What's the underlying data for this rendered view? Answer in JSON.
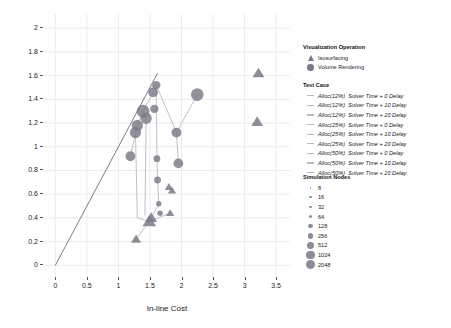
{
  "chart_data": {
    "type": "scatter",
    "title": "",
    "xlabel": "In-line Cost",
    "ylabel": "In-transit Cost",
    "xlim": [
      -0.18,
      3.72
    ],
    "ylim": [
      -0.09,
      2.12
    ],
    "xticks": [
      "0",
      "0.5",
      "1",
      "1.5",
      "2",
      "2.5",
      "3",
      "3.5"
    ],
    "xtickvals": [
      0,
      0.5,
      1,
      1.5,
      2,
      2.5,
      3,
      3.5
    ],
    "yticks": [
      "0",
      "0.2",
      "0.4",
      "0.6",
      "0.8",
      "1",
      "1.2",
      "1.4",
      "1.6",
      "1.8",
      "2"
    ],
    "ytickvals": [
      0,
      0.2,
      0.4,
      0.6,
      0.8,
      1.0,
      1.2,
      1.4,
      1.6,
      1.8,
      2.0
    ],
    "grid": true,
    "reference_line": {
      "type": "identity",
      "from": [
        0,
        0
      ],
      "to": [
        1.62,
        1.62
      ],
      "color": "#5a5a66"
    },
    "legend_position": "right",
    "marker_color": "#7a7a86",
    "line_color": "#b9b9c4",
    "series": [
      {
        "name": "Volume Rendering",
        "marker": "circle",
        "points": [
          {
            "x": 1.19,
            "y": 0.92,
            "nodes": 256
          },
          {
            "x": 1.27,
            "y": 1.12,
            "nodes": 512
          },
          {
            "x": 1.3,
            "y": 1.18,
            "nodes": 512
          },
          {
            "x": 1.39,
            "y": 1.3,
            "nodes": 1024
          },
          {
            "x": 1.44,
            "y": 1.24,
            "nodes": 512
          },
          {
            "x": 1.55,
            "y": 1.46,
            "nodes": 256
          },
          {
            "x": 1.57,
            "y": 1.32,
            "nodes": 128
          },
          {
            "x": 1.6,
            "y": 1.52,
            "nodes": 128
          },
          {
            "x": 1.61,
            "y": 0.9,
            "nodes": 64
          },
          {
            "x": 1.62,
            "y": 0.72,
            "nodes": 64
          },
          {
            "x": 1.64,
            "y": 0.52,
            "nodes": 32
          },
          {
            "x": 1.66,
            "y": 0.44,
            "nodes": 32
          },
          {
            "x": 1.92,
            "y": 1.12,
            "nodes": 256
          },
          {
            "x": 1.95,
            "y": 0.86,
            "nodes": 256
          },
          {
            "x": 2.25,
            "y": 1.44,
            "nodes": 1024
          }
        ]
      },
      {
        "name": "Isosurfacing",
        "marker": "triangle",
        "points": [
          {
            "x": 1.49,
            "y": 0.37,
            "nodes": 512
          },
          {
            "x": 1.52,
            "y": 0.4,
            "nodes": 256
          },
          {
            "x": 1.28,
            "y": 0.22,
            "nodes": 128
          },
          {
            "x": 1.8,
            "y": 0.66,
            "nodes": 64
          },
          {
            "x": 1.85,
            "y": 0.63,
            "nodes": 64
          },
          {
            "x": 1.82,
            "y": 0.44,
            "nodes": 64
          },
          {
            "x": 3.22,
            "y": 1.62,
            "nodes": 256
          },
          {
            "x": 3.2,
            "y": 1.21,
            "nodes": 256
          }
        ]
      }
    ],
    "connector_paths": [
      [
        [
          1.19,
          0.92
        ],
        [
          1.3,
          1.18
        ],
        [
          1.39,
          1.3
        ],
        [
          1.55,
          1.46
        ],
        [
          1.6,
          1.52
        ]
      ],
      [
        [
          1.6,
          1.52
        ],
        [
          1.92,
          1.12
        ],
        [
          2.25,
          1.44
        ]
      ],
      [
        [
          1.92,
          1.12
        ],
        [
          1.95,
          0.86
        ]
      ],
      [
        [
          1.39,
          1.3
        ],
        [
          1.44,
          1.24
        ],
        [
          1.42,
          0.42
        ]
      ],
      [
        [
          1.6,
          1.52
        ],
        [
          1.61,
          0.9
        ],
        [
          1.62,
          0.72
        ],
        [
          1.64,
          0.52
        ],
        [
          1.5,
          0.38
        ]
      ],
      [
        [
          1.27,
          1.12
        ],
        [
          1.3,
          0.4
        ],
        [
          1.49,
          0.37
        ]
      ],
      [
        [
          1.49,
          0.37
        ],
        [
          1.28,
          0.22
        ]
      ],
      [
        [
          1.49,
          0.37
        ],
        [
          1.82,
          0.44
        ]
      ]
    ]
  },
  "legends": {
    "visualization_operation": {
      "title": "Visualization Operation",
      "items": [
        {
          "label": "Isosurfacing",
          "marker": "triangle"
        },
        {
          "label": "Volume Rendering",
          "marker": "circle"
        }
      ]
    },
    "test_case": {
      "title": "Test Case",
      "items": [
        {
          "alloc": "Alloc(12%)",
          "detail": "Solver Time + 0 Delay"
        },
        {
          "alloc": "Alloc(12%)",
          "detail": "Solver Time + 10 Delay"
        },
        {
          "alloc": "Alloc(12%)",
          "detail": "Solver Time + 20 Delay"
        },
        {
          "alloc": "Alloc(25%)",
          "detail": "Solver Time + 0 Delay"
        },
        {
          "alloc": "Alloc(25%)",
          "detail": "Solver Time + 10 Delay"
        },
        {
          "alloc": "Alloc(25%)",
          "detail": "Solver Time + 20 Delay"
        },
        {
          "alloc": "Alloc(50%)",
          "detail": "Solver Time + 0 Delay"
        },
        {
          "alloc": "Alloc(50%)",
          "detail": "Solver Time + 10 Delay"
        },
        {
          "alloc": "Alloc(50%)",
          "detail": "Solver Time + 20 Delay"
        }
      ]
    },
    "simulation_nodes": {
      "title": "Simulation Nodes",
      "items": [
        {
          "label": "8",
          "size": 1.6
        },
        {
          "label": "16",
          "size": 2.2
        },
        {
          "label": "32",
          "size": 2.9
        },
        {
          "label": "64",
          "size": 3.7
        },
        {
          "label": "128",
          "size": 4.6
        },
        {
          "label": "256",
          "size": 5.6
        },
        {
          "label": "512",
          "size": 6.8
        },
        {
          "label": "1024",
          "size": 8.2
        },
        {
          "label": "2048",
          "size": 9.8
        }
      ]
    }
  }
}
